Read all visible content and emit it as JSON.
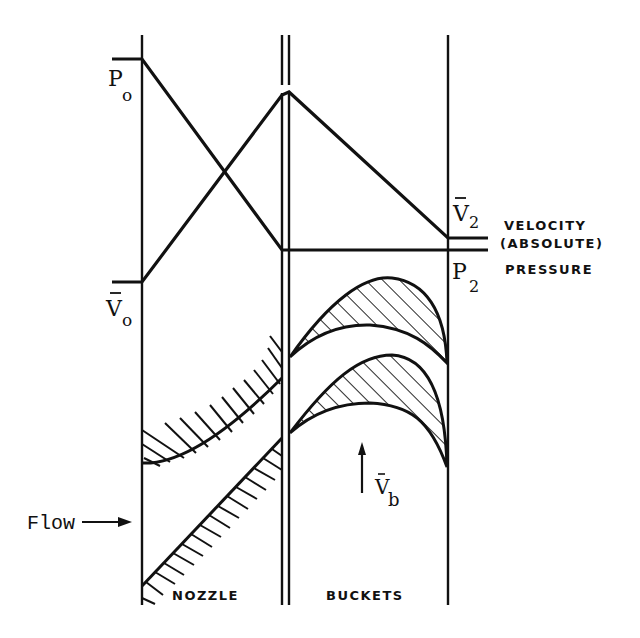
{
  "diagram": {
    "type": "impulse-turbine-stage",
    "colors": {
      "ink": "#111111",
      "background": "#ffffff"
    },
    "labels": {
      "p0": "P",
      "p0_sub": "o",
      "v0": "V",
      "v0_sub": "o",
      "v2": "V",
      "v2_sub": "2",
      "p2": "P",
      "p2_sub": "2",
      "velocity_line1": "VELOCITY",
      "velocity_line2": "(ABSOLUTE)",
      "pressure": "PRESSURE",
      "vb": "V",
      "vb_sub": "b",
      "flow": "Flow",
      "nozzle": "NOZZLE",
      "buckets": "BUCKETS"
    },
    "curves": {
      "pressure": "drops from P0 across nozzle, constant through buckets to P2",
      "velocity_absolute": "rises from V0 across nozzle to peak, falls across buckets to V2"
    }
  }
}
